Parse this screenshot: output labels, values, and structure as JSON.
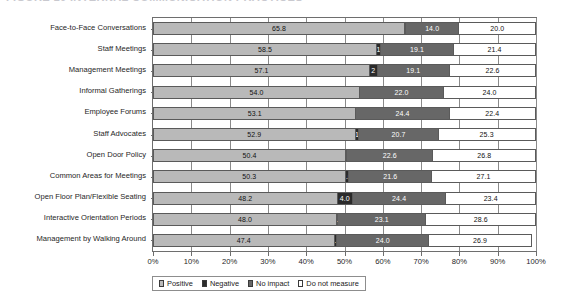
{
  "caption": {
    "text": "FIGURE 10   INTERNAL COMMUNICATION PRACTICES"
  },
  "legend": {
    "position": "bottom",
    "items": [
      {
        "label": "Positive",
        "color": "#b9b9b9",
        "icon": "legend-swatch-icon"
      },
      {
        "label": "Negative",
        "color": "#2b2b2b",
        "icon": "legend-swatch-icon"
      },
      {
        "label": "No impact",
        "color": "#676767",
        "icon": "legend-swatch-icon"
      },
      {
        "label": "Do not measure",
        "color": "#ffffff",
        "icon": "legend-swatch-icon"
      }
    ]
  },
  "chart_data": {
    "type": "bar",
    "orientation": "horizontal",
    "stacked": true,
    "stack_mode": "percent",
    "title": "",
    "xlabel": "",
    "ylabel": "",
    "xlim": [
      0,
      100
    ],
    "grid": true,
    "legend_position": "bottom",
    "x_ticks": [
      "0%",
      "10%",
      "20%",
      "30%",
      "40%",
      "50%",
      "60%",
      "70%",
      "80%",
      "90%",
      "100%"
    ],
    "x_tick_values": [
      0,
      10,
      20,
      30,
      40,
      50,
      60,
      70,
      80,
      90,
      100
    ],
    "categories": [
      "Face-to-Face Conversations",
      "Staff Meetings",
      "Management Meetings",
      "Informal Gatherings",
      "Employee Forums",
      "Staff Advocates",
      "Open Door Policy",
      "Common Areas for Meetings",
      "Open Floor Plan/Flexible Seating",
      "Interactive Orientation Periods",
      "Management by Walking Around"
    ],
    "series": [
      {
        "name": "Positive",
        "color": "#b9b9b9",
        "values": [
          65.8,
          58.5,
          57.1,
          54.0,
          53.1,
          52.9,
          50.4,
          50.3,
          48.2,
          48.0,
          47.4
        ],
        "labels": [
          "65.8",
          "58.5",
          "57.1",
          "54.0",
          "53.1",
          "52.9",
          "50.4",
          "50.3",
          "48.2",
          "48.0",
          "47.4"
        ]
      },
      {
        "name": "Negative",
        "color": "#2b2b2b",
        "values": [
          0.2,
          1.0,
          2.0,
          0.0,
          0.0,
          1.0,
          0.2,
          1.0,
          4.0,
          0.3,
          0.7
        ],
        "labels": [
          "0.2",
          "1",
          "2",
          "",
          "",
          "1",
          "0.2",
          "1.0",
          "4.0",
          "0.3",
          "0.7"
        ]
      },
      {
        "name": "No impact",
        "color": "#676767",
        "values": [
          14.0,
          19.1,
          19.1,
          22.0,
          24.4,
          20.7,
          22.6,
          21.6,
          24.4,
          23.1,
          24.0
        ],
        "labels": [
          "14.0",
          "19.1",
          "19.1",
          "22.0",
          "24.4",
          "20.7",
          "22.6",
          "21.6",
          "24.4",
          "23.1",
          "24.0"
        ]
      },
      {
        "name": "Do not measure",
        "color": "#ffffff",
        "values": [
          20.0,
          21.4,
          22.6,
          24.0,
          22.4,
          25.3,
          26.8,
          27.1,
          23.4,
          28.6,
          26.9
        ],
        "labels": [
          "20.0",
          "21.4",
          "22.6",
          "24.0",
          "22.4",
          "25.3",
          "26.8",
          "27.1",
          "23.4",
          "28.6",
          "26.9"
        ]
      }
    ]
  }
}
